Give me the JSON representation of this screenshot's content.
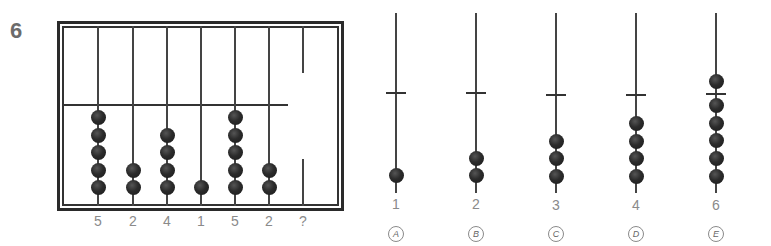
{
  "question_number": "6",
  "abacus": {
    "rods": [
      {
        "label": "5",
        "beads": 5
      },
      {
        "label": "2",
        "beads": 2
      },
      {
        "label": "4",
        "beads": 4
      },
      {
        "label": "1",
        "beads": 1
      },
      {
        "label": "5",
        "beads": 5
      },
      {
        "label": "2",
        "beads": 2
      },
      {
        "label": "?",
        "beads": 0
      }
    ]
  },
  "options": [
    {
      "letter": "A",
      "value": "1",
      "beads_below": 1,
      "beads_above": 0
    },
    {
      "letter": "B",
      "value": "2",
      "beads_below": 2,
      "beads_above": 0
    },
    {
      "letter": "C",
      "value": "3",
      "beads_below": 3,
      "beads_above": 0
    },
    {
      "letter": "D",
      "value": "4",
      "beads_below": 4,
      "beads_above": 0
    },
    {
      "letter": "E",
      "value": "6",
      "beads_below": 5,
      "beads_above": 1
    }
  ],
  "colors": {
    "bead": "#222222",
    "label": "#8a8a8a",
    "frame": "#2a2a2a"
  }
}
